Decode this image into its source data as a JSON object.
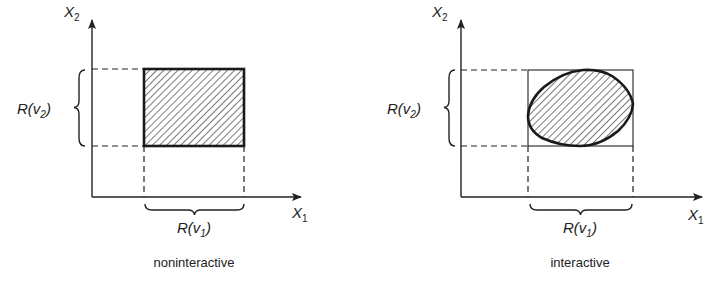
{
  "diagrams": [
    {
      "id": "left",
      "caption": "noninteractive",
      "x_axis_label": "X",
      "x_axis_sub": "1",
      "y_axis_label": "X",
      "y_axis_sub": "2",
      "range_x_label": "R(v",
      "range_x_sub": "1",
      "range_x_close": ")",
      "range_y_label": "R(v",
      "range_y_sub": "2",
      "range_y_close": ")",
      "region_shape": "rectangle (hatched)"
    },
    {
      "id": "right",
      "caption": "interactive",
      "x_axis_label": "X",
      "x_axis_sub": "1",
      "y_axis_label": "X",
      "y_axis_sub": "2",
      "range_x_label": "R(v",
      "range_x_sub": "1",
      "range_x_close": ")",
      "range_y_label": "R(v",
      "range_y_sub": "2",
      "range_y_close": ")",
      "region_shape": "oval blob (hatched) inscribed in rectangle"
    }
  ],
  "colors": {
    "ink": "#222222",
    "background": "#ffffff"
  }
}
